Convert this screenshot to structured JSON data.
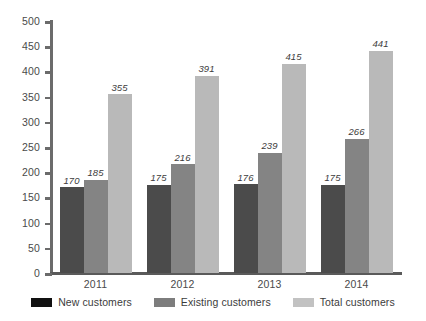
{
  "chart_data": {
    "type": "bar",
    "title": "",
    "subtitle": "",
    "xlabel": "",
    "ylabel": "",
    "categories": [
      "2011",
      "2012",
      "2013",
      "2014"
    ],
    "series": [
      {
        "name": "New customers",
        "color": "#4b4b4b",
        "legend_color": "#111111",
        "values": [
          170,
          175,
          176,
          175
        ]
      },
      {
        "name": "Existing customers",
        "color": "#848484",
        "legend_color": "#7d7d7d",
        "values": [
          185,
          216,
          239,
          266
        ]
      },
      {
        "name": "Total customers",
        "color": "#b9b9b9",
        "legend_color": "#c2c2c2",
        "values": [
          355,
          391,
          415,
          441
        ]
      }
    ],
    "ylim": [
      0,
      500
    ],
    "ytick_step": 50,
    "yticks": [
      0,
      50,
      100,
      150,
      200,
      250,
      300,
      350,
      400,
      450,
      500
    ],
    "ytick_labels": [
      "0",
      "50",
      "100",
      "150",
      "200",
      "250",
      "300",
      "350",
      "400",
      "450",
      "500"
    ],
    "grid": false,
    "data_labels": true,
    "data_label_style": "italic",
    "legend_position": "bottom",
    "bar_group_gap": true,
    "bar_inner_gap": false,
    "background_color": "#ffffff",
    "axis_color": "#5a5a5a",
    "text_color": "#3c3c3c"
  }
}
